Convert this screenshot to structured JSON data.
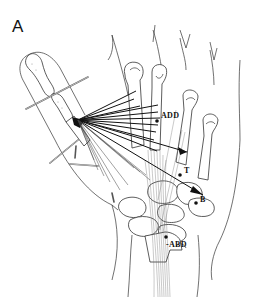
{
  "figure": {
    "panel_label": "A",
    "labels": {
      "add": "ADD",
      "t": "T",
      "b": "B",
      "abd": "-ABD"
    },
    "colors": {
      "background": "#ffffff",
      "line": "#333333",
      "vector": "#111111"
    }
  }
}
